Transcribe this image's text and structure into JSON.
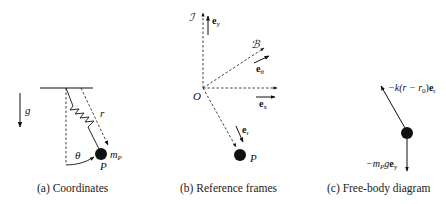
{
  "colors": {
    "ink": "#111111",
    "background": "#ffffff"
  },
  "panels": [
    {
      "id": "a",
      "caption": "(a) Coordinates",
      "labels": {
        "gravity": "g",
        "length": "r",
        "angle": "θ",
        "mass": "m",
        "mass_sub": "P",
        "point": "P"
      }
    },
    {
      "id": "b",
      "caption": "(b) Reference frames",
      "labels": {
        "inertial_frame": "ℐ",
        "body_frame": "ℬ",
        "origin": "O",
        "point": "P",
        "e_y": "e",
        "e_y_sub": "y",
        "e_theta": "e",
        "e_theta_sub": "θ",
        "e_x": "e",
        "e_x_sub": "x",
        "e_r": "e",
        "e_r_sub": "r"
      }
    },
    {
      "id": "c",
      "caption": "(c) Free-body diagram",
      "labels": {
        "spring_force_prefix": "−k(r − r",
        "spring_force_sub": "0",
        "spring_force_mid": ")",
        "spring_force_vec": "e",
        "spring_force_vec_sub": "r",
        "gravity_force_prefix": "−m",
        "gravity_force_sub": "P",
        "gravity_force_g": "g",
        "gravity_force_vec": "e",
        "gravity_force_vec_sub": "y"
      }
    }
  ]
}
